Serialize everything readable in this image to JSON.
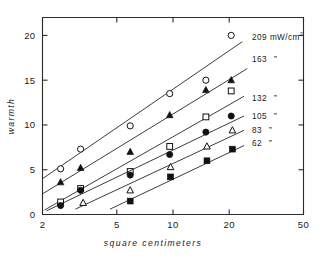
{
  "chart_data": {
    "type": "scatter",
    "title": "",
    "xlabel": "square centimeters",
    "ylabel": "warmth",
    "xscale": "log",
    "yscale": "linear",
    "xlim": [
      2,
      50
    ],
    "ylim": [
      0,
      22
    ],
    "xticks": [
      2,
      5,
      10,
      20,
      50
    ],
    "xtick_labels": [
      "2",
      "5",
      "10",
      "20",
      "50"
    ],
    "yticks": [
      0,
      5,
      10,
      15,
      20
    ],
    "ytick_labels": [
      "0",
      "5",
      "10",
      "15",
      "20"
    ],
    "grid": false,
    "legend_position": "right-outside",
    "legend_unit": "mW/cm",
    "legend_unit_sup": "2",
    "legend_ditto": "”",
    "series": [
      {
        "name": "209",
        "label": "209 mW/cm2",
        "marker": "open-circle",
        "points": [
          {
            "x": 2.5,
            "y": 5.1
          },
          {
            "x": 3.2,
            "y": 7.3
          },
          {
            "x": 5.9,
            "y": 9.9
          },
          {
            "x": 9.6,
            "y": 13.5
          },
          {
            "x": 15.0,
            "y": 15.0
          },
          {
            "x": 20.5,
            "y": 20.0
          }
        ],
        "fit": {
          "x1": 2.0,
          "y1": 4.0,
          "x2": 23.5,
          "y2": 19.3
        }
      },
      {
        "name": "163",
        "label": "163",
        "marker": "filled-triangle",
        "points": [
          {
            "x": 2.5,
            "y": 3.6
          },
          {
            "x": 3.2,
            "y": 5.2
          },
          {
            "x": 5.9,
            "y": 7.0
          },
          {
            "x": 9.6,
            "y": 11.1
          },
          {
            "x": 15.0,
            "y": 13.9
          },
          {
            "x": 20.5,
            "y": 15.0
          }
        ],
        "fit": {
          "x1": 2.0,
          "y1": 2.3,
          "x2": 25.0,
          "y2": 16.3
        }
      },
      {
        "name": "132",
        "label": "132",
        "marker": "open-square",
        "points": [
          {
            "x": 2.5,
            "y": 1.4
          },
          {
            "x": 3.2,
            "y": 2.9
          },
          {
            "x": 5.9,
            "y": 4.8
          },
          {
            "x": 9.6,
            "y": 7.6
          },
          {
            "x": 15.0,
            "y": 10.9
          },
          {
            "x": 20.5,
            "y": 13.8
          }
        ],
        "fit": {
          "x1": 2.05,
          "y1": 0.5,
          "x2": 24.0,
          "y2": 13.2
        }
      },
      {
        "name": "105",
        "label": "105",
        "marker": "filled-circle",
        "points": [
          {
            "x": 2.5,
            "y": 1.0
          },
          {
            "x": 3.2,
            "y": 2.7
          },
          {
            "x": 5.9,
            "y": 4.4
          },
          {
            "x": 9.6,
            "y": 6.7
          },
          {
            "x": 15.0,
            "y": 9.2
          },
          {
            "x": 20.5,
            "y": 11.0
          }
        ],
        "fit": {
          "x1": 2.1,
          "y1": 0.4,
          "x2": 24.0,
          "y2": 11.0
        }
      },
      {
        "name": "83",
        "label": "83",
        "marker": "open-triangle",
        "points": [
          {
            "x": 3.3,
            "y": 1.3
          },
          {
            "x": 5.9,
            "y": 2.7
          },
          {
            "x": 9.7,
            "y": 5.3
          },
          {
            "x": 15.2,
            "y": 7.6
          },
          {
            "x": 20.8,
            "y": 9.4
          }
        ],
        "fit": {
          "x1": 3.0,
          "y1": 0.6,
          "x2": 24.0,
          "y2": 9.4
        }
      },
      {
        "name": "62",
        "label": "62",
        "marker": "filled-square",
        "points": [
          {
            "x": 5.9,
            "y": 1.5
          },
          {
            "x": 9.7,
            "y": 4.2
          },
          {
            "x": 15.2,
            "y": 6.0
          },
          {
            "x": 20.8,
            "y": 7.3
          }
        ],
        "fit": {
          "x1": 4.6,
          "y1": 0.6,
          "x2": 24.0,
          "y2": 7.7
        }
      }
    ]
  },
  "legend_entries": [
    {
      "value": "209",
      "unit": "mW/cm",
      "sup": "2",
      "ditto": ""
    },
    {
      "value": "163",
      "unit": "",
      "sup": "",
      "ditto": "”"
    },
    {
      "value": "132",
      "unit": "",
      "sup": "",
      "ditto": "”"
    },
    {
      "value": "105",
      "unit": "",
      "sup": "",
      "ditto": "”"
    },
    {
      "value": "83",
      "unit": "",
      "sup": "",
      "ditto": "”"
    },
    {
      "value": "62",
      "unit": "",
      "sup": "",
      "ditto": "”"
    }
  ]
}
